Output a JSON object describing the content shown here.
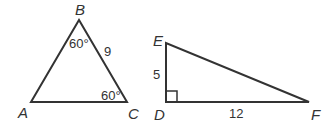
{
  "diagram": {
    "colors": {
      "stroke": "#333333",
      "background": "#ffffff"
    },
    "triangle_abc": {
      "vertices": {
        "A": "A",
        "B": "B",
        "C": "C"
      },
      "angle_B": "60°",
      "angle_C": "60°",
      "side_BC": "9"
    },
    "triangle_def": {
      "vertices": {
        "D": "D",
        "E": "E",
        "F": "F"
      },
      "side_DE": "5",
      "side_DF": "12",
      "right_angle_at": "D"
    }
  }
}
